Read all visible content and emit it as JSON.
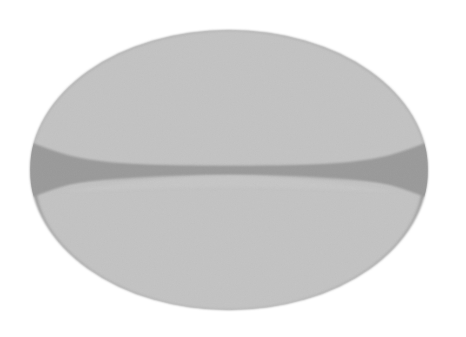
{
  "figure": {
    "title": "Grayscale ellipse with bilobed cleft",
    "background_color": "#ffffff",
    "canvas": {
      "width": 466,
      "height": 337
    }
  },
  "shapes": {
    "outer_ellipse": {
      "name": "outer-ellipse",
      "fill": "#9a9a9a",
      "cx": 229,
      "cy": 170,
      "rx": 199,
      "ry": 140
    },
    "upper_lobe": {
      "name": "upper-lobe",
      "fill": "#c3c3c3",
      "description": "dome-shaped upper half with flattened lower edge"
    },
    "lower_lobe": {
      "name": "lower-lobe",
      "fill": "#c3c3c3",
      "description": "dome-shaped lower half with flattened upper edge"
    },
    "cleft_band": {
      "name": "cleft-band",
      "fill": "#9a9a9a",
      "center_y": 169,
      "center_thickness": 7,
      "edge_thickness": 58
    }
  },
  "palette": {
    "background": "#ffffff",
    "lobe_gray": "#c3c3c3",
    "cleft_gray": "#9a9a9a",
    "edge_soft_gray": "#b4b4b4"
  }
}
